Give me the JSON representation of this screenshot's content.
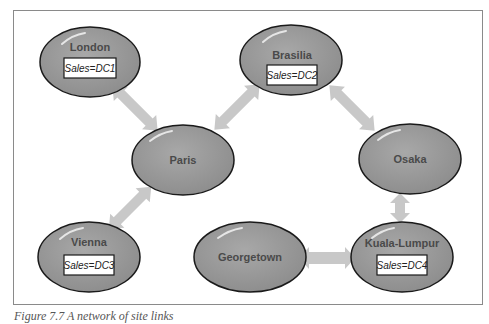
{
  "figure": {
    "caption": "Figure 7.7 A network of site links",
    "colors": {
      "frame": "#8a8a8a",
      "node_fill": "#9a9a9a",
      "node_stroke": "#1a1a1a",
      "link": "#c8c8c8",
      "label": "#4a4a4a",
      "box_fill": "#ffffff"
    }
  },
  "nodes": [
    {
      "id": "london",
      "label": "London",
      "sales": "Sales=DC1"
    },
    {
      "id": "brasilia",
      "label": "Brasilia",
      "sales": "Sales=DC2"
    },
    {
      "id": "paris",
      "label": "Paris"
    },
    {
      "id": "osaka",
      "label": "Osaka"
    },
    {
      "id": "vienna",
      "label": "Vienna",
      "sales": "Sales=DC3"
    },
    {
      "id": "georgetown",
      "label": "Georgetown"
    },
    {
      "id": "kuala-lumpur",
      "label": "Kuala-Lumpur",
      "sales": "Sales=DC4"
    }
  ],
  "links": [
    [
      "London",
      "Paris"
    ],
    [
      "Paris",
      "Brasilia"
    ],
    [
      "Paris",
      "Vienna"
    ],
    [
      "Brasilia",
      "Osaka"
    ],
    [
      "Osaka",
      "Kuala-Lumpur"
    ],
    [
      "Georgetown",
      "Kuala-Lumpur"
    ]
  ]
}
